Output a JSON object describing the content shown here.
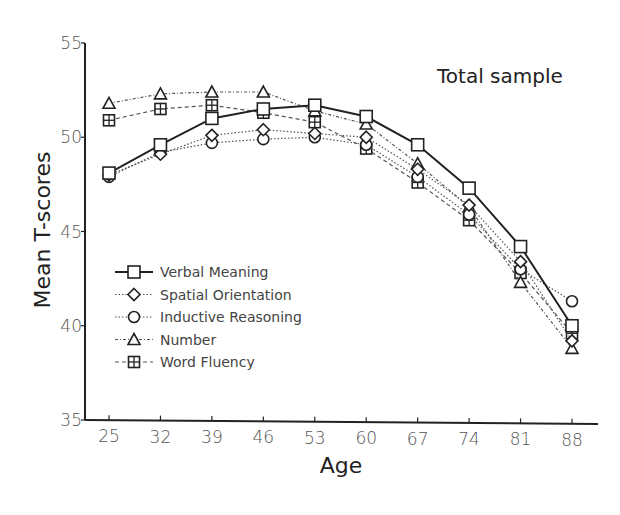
{
  "chart_data": {
    "type": "line",
    "title": "Total sample",
    "xlabel": "Age",
    "ylabel": "Mean T-scores",
    "x": [
      25,
      32,
      39,
      46,
      53,
      60,
      67,
      74,
      81,
      88
    ],
    "x_tick_labels": [
      "25",
      "32",
      "39",
      "46",
      "53",
      "60",
      "67",
      "74",
      "81",
      "88"
    ],
    "y_ticks": [
      35,
      40,
      45,
      50,
      55
    ],
    "y_tick_labels": [
      "35",
      "40",
      "45",
      "50",
      "55"
    ],
    "ylim": [
      35,
      55
    ],
    "grid": false,
    "legend_position": "lower-left",
    "series": [
      {
        "name": "Verbal Meaning",
        "marker": "square",
        "line": "solid",
        "values": [
          48.1,
          49.6,
          51.0,
          51.5,
          51.7,
          51.1,
          49.6,
          47.3,
          44.2,
          40.0
        ]
      },
      {
        "name": "Spatial Orientation",
        "marker": "diamond",
        "line": "dotted",
        "values": [
          48.0,
          49.1,
          50.1,
          50.4,
          50.2,
          50.0,
          48.3,
          46.4,
          43.4,
          39.2
        ]
      },
      {
        "name": "Inductive Reasoning",
        "marker": "circle",
        "line": "dotted",
        "values": [
          47.9,
          49.2,
          49.7,
          49.9,
          50.0,
          49.6,
          47.9,
          45.9,
          43.0,
          41.3
        ]
      },
      {
        "name": "Number",
        "marker": "triangle",
        "line": "dash-dot",
        "values": [
          51.8,
          52.3,
          52.4,
          52.4,
          51.4,
          50.7,
          48.6,
          46.3,
          42.3,
          38.8
        ]
      },
      {
        "name": "Word Fluency",
        "marker": "boxed-plus",
        "line": "dashed",
        "values": [
          50.9,
          51.5,
          51.7,
          51.3,
          50.8,
          49.4,
          47.6,
          45.6,
          42.8,
          39.6
        ]
      }
    ]
  },
  "legend": {
    "items": [
      {
        "label": "Verbal Meaning"
      },
      {
        "label": "Spatial Orientation"
      },
      {
        "label": "Inductive Reasoning"
      },
      {
        "label": "Number"
      },
      {
        "label": "Word Fluency"
      }
    ]
  }
}
